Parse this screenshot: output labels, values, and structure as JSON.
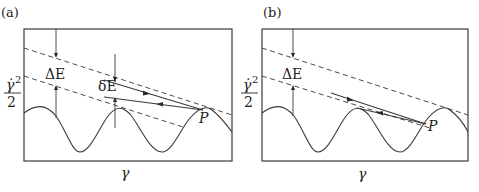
{
  "figure": {
    "panels": [
      {
        "id": "a",
        "label": "(a)",
        "frame": {
          "x": 24,
          "y": 29,
          "w": 208,
          "h": 132
        },
        "y_axis_label": {
          "numerator": "γ̇",
          "power": "2",
          "denominator": "2"
        },
        "x_axis_label": "γ",
        "delta_E_label": "ΔE",
        "small_delta_E_label": "δE",
        "point_label": "P",
        "has_small_delta_E": true
      },
      {
        "id": "b",
        "label": "(b)",
        "frame": {
          "x": 262,
          "y": 29,
          "w": 206,
          "h": 132
        },
        "y_axis_label": {
          "numerator": "γ̇",
          "power": "2",
          "denominator": "2"
        },
        "x_axis_label": "γ",
        "delta_E_label": "ΔE",
        "point_label": "P",
        "has_small_delta_E": false
      }
    ],
    "colors": {
      "line": "#3a3a3a",
      "background": "#ffffff"
    }
  }
}
